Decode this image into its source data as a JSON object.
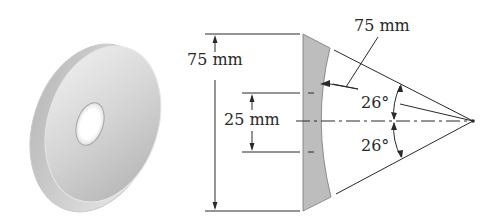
{
  "figure": {
    "object_view": "3d-washer",
    "labels": {
      "outer_height": "75 mm",
      "radius": "75 mm",
      "inner_height": "25 mm",
      "upper_angle": "26°",
      "lower_angle": "26°"
    },
    "colors": {
      "line": "#2a2a2a",
      "section_fill": "#bdbdbd",
      "washer_light": "#ececec",
      "washer_mid": "#cfcfcf",
      "washer_dark": "#a8a8a8"
    }
  }
}
